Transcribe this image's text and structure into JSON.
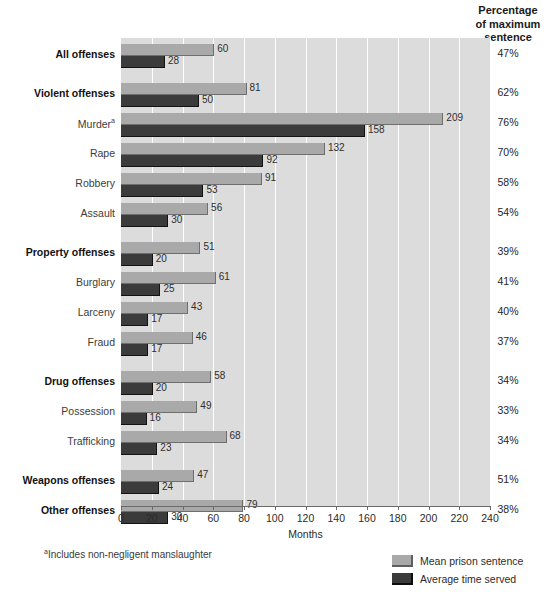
{
  "header": {
    "pct_column_title_line1": "Percentage",
    "pct_column_title_line2": "of maximum",
    "pct_column_title_line3": "sentence"
  },
  "footnote": {
    "marker": "a",
    "text": "Includes non-negligent manslaughter"
  },
  "legend": {
    "position": "bottom-right",
    "items": [
      {
        "label": "Mean prison sentence",
        "color": "#a9a9a9",
        "key": "mean"
      },
      {
        "label": "Average time served",
        "color": "#3b3b3b",
        "key": "served"
      }
    ]
  },
  "chart_data": {
    "type": "bar",
    "orientation": "horizontal",
    "title": "",
    "subtitle": "",
    "xlabel": "Months",
    "ylabel": "",
    "xlim": [
      0,
      240
    ],
    "xticks": [
      0,
      20,
      40,
      60,
      80,
      100,
      120,
      140,
      160,
      180,
      200,
      220,
      240
    ],
    "grid": true,
    "grid_axis": "x",
    "legend_position": "bottom-right",
    "categories": [
      "All offenses",
      "Violent offenses",
      "Murder",
      "Rape",
      "Robbery",
      "Assault",
      "Property offenses",
      "Burglary",
      "Larceny",
      "Fraud",
      "Drug offenses",
      "Possession",
      "Trafficking",
      "Weapons offenses",
      "Other offenses"
    ],
    "series": [
      {
        "name": "Mean prison sentence",
        "color": "#a9a9a9",
        "values": [
          60,
          81,
          209,
          132,
          91,
          56,
          51,
          61,
          43,
          46,
          58,
          49,
          68,
          47,
          79
        ]
      },
      {
        "name": "Average time served",
        "color": "#3b3b3b",
        "values": [
          28,
          50,
          158,
          92,
          53,
          30,
          20,
          25,
          17,
          17,
          20,
          16,
          23,
          24,
          30
        ]
      }
    ],
    "annotations": {
      "column_title": "Percentage of maximum sentence",
      "column_values": [
        "47%",
        "62%",
        "76%",
        "70%",
        "58%",
        "54%",
        "39%",
        "41%",
        "40%",
        "37%",
        "34%",
        "33%",
        "34%",
        "51%",
        "38%"
      ]
    }
  },
  "rows": [
    {
      "label": "All offenses",
      "bold": true,
      "footnote": "",
      "mean": 60,
      "served": 28,
      "pct": "47%",
      "group_gap_before": false
    },
    {
      "label": "Violent offenses",
      "bold": true,
      "footnote": "",
      "mean": 81,
      "served": 50,
      "pct": "62%",
      "group_gap_before": true
    },
    {
      "label": "Murder",
      "bold": false,
      "footnote": "a",
      "mean": 209,
      "served": 158,
      "pct": "76%",
      "group_gap_before": false
    },
    {
      "label": "Rape",
      "bold": false,
      "footnote": "",
      "mean": 132,
      "served": 92,
      "pct": "70%",
      "group_gap_before": false
    },
    {
      "label": "Robbery",
      "bold": false,
      "footnote": "",
      "mean": 91,
      "served": 53,
      "pct": "58%",
      "group_gap_before": false
    },
    {
      "label": "Assault",
      "bold": false,
      "footnote": "",
      "mean": 56,
      "served": 30,
      "pct": "54%",
      "group_gap_before": false
    },
    {
      "label": "Property offenses",
      "bold": true,
      "footnote": "",
      "mean": 51,
      "served": 20,
      "pct": "39%",
      "group_gap_before": true
    },
    {
      "label": "Burglary",
      "bold": false,
      "footnote": "",
      "mean": 61,
      "served": 25,
      "pct": "41%",
      "group_gap_before": false
    },
    {
      "label": "Larceny",
      "bold": false,
      "footnote": "",
      "mean": 43,
      "served": 17,
      "pct": "40%",
      "group_gap_before": false
    },
    {
      "label": "Fraud",
      "bold": false,
      "footnote": "",
      "mean": 46,
      "served": 17,
      "pct": "37%",
      "group_gap_before": false
    },
    {
      "label": "Drug offenses",
      "bold": true,
      "footnote": "",
      "mean": 58,
      "served": 20,
      "pct": "34%",
      "group_gap_before": true
    },
    {
      "label": "Possession",
      "bold": false,
      "footnote": "",
      "mean": 49,
      "served": 16,
      "pct": "33%",
      "group_gap_before": false
    },
    {
      "label": "Trafficking",
      "bold": false,
      "footnote": "",
      "mean": 68,
      "served": 23,
      "pct": "34%",
      "group_gap_before": false
    },
    {
      "label": "Weapons offenses",
      "bold": true,
      "footnote": "",
      "mean": 47,
      "served": 24,
      "pct": "51%",
      "group_gap_before": true
    },
    {
      "label": "Other offenses",
      "bold": true,
      "footnote": "",
      "mean": 79,
      "served": 30,
      "pct": "38%",
      "group_gap_before": false
    }
  ]
}
